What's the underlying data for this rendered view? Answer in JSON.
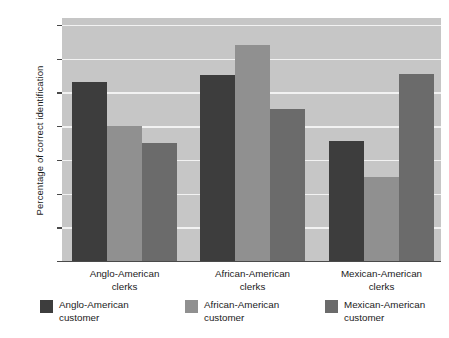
{
  "chart_data": {
    "type": "bar",
    "title": "",
    "subtitle": "",
    "xlabel": "",
    "ylabel": "Percentage of correct identification",
    "ylim": [
      0,
      72
    ],
    "yticks": [
      0,
      10,
      20,
      30,
      40,
      50,
      60,
      70
    ],
    "ytick_labels": [
      "0",
      "10",
      "20",
      "30",
      "40",
      "50",
      "60",
      "70"
    ],
    "grid": true,
    "legend_position": "bottom",
    "categories": [
      "Anglo-American\nclerks",
      "African-American\nclerks",
      "Mexican-American\nclerks"
    ],
    "series": [
      {
        "name": "Anglo-American\ncustomer",
        "color": "#3d3d3d",
        "values": [
          53,
          55,
          35.5
        ]
      },
      {
        "name": "African-American\ncustomer",
        "color": "#909090",
        "values": [
          40,
          64,
          25
        ]
      },
      {
        "name": "Mexican-American\ncustomer",
        "color": "#6b6b6b",
        "values": [
          35,
          45,
          55.5
        ]
      }
    ],
    "plot_background": "#c6c6c6",
    "gridline_color": "#f2f2f2",
    "axis_color": "#4a4a4a"
  },
  "axis": {
    "y_title": "Percentage of correct identification"
  },
  "groups": [
    {
      "line1": "Anglo-American",
      "line2": "clerks"
    },
    {
      "line1": "African-American",
      "line2": "clerks"
    },
    {
      "line1": "Mexican-American",
      "line2": "clerks"
    }
  ],
  "legend": [
    {
      "line1": "Anglo-American",
      "line2": "customer",
      "color": "#3d3d3d"
    },
    {
      "line1": "African-American",
      "line2": "customer",
      "color": "#909090"
    },
    {
      "line1": "Mexican-American",
      "line2": "customer",
      "color": "#6b6b6b"
    }
  ]
}
